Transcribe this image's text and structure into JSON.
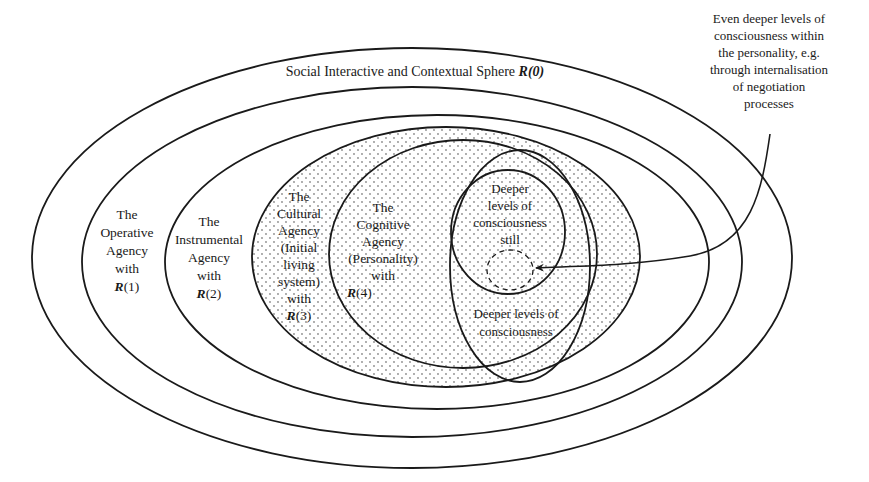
{
  "diagram": {
    "outer_sphere": {
      "label": "Social Interactive and Contextual Sphere ",
      "r_label": "R(0)"
    },
    "spheres": [
      {
        "id": "operative",
        "lines": [
          "The",
          "Operative",
          "Agency",
          "with"
        ],
        "r_label": "R",
        "r_index": "(1)"
      },
      {
        "id": "instrumental",
        "lines": [
          "The",
          "Instrumental",
          "Agency",
          "with"
        ],
        "r_label": "R",
        "r_index": "(2)"
      },
      {
        "id": "cultural",
        "lines": [
          "The",
          "Cultural",
          "Agency",
          "(Initial",
          "living",
          "system)",
          "with"
        ],
        "r_label": "R",
        "r_index": "(3)"
      },
      {
        "id": "cognitive",
        "lines": [
          "The",
          "Cognitive",
          "Agency",
          "(Personality)",
          "with"
        ],
        "r_label": "R",
        "r_index": "(4)"
      }
    ],
    "deeper": {
      "lines": [
        "Deeper levels of",
        "consciousness"
      ]
    },
    "deeper_still": {
      "lines": [
        "Deeper",
        "levels of",
        "consciousness",
        "still"
      ]
    },
    "annotation": {
      "lines": [
        "Even deeper levels of",
        "consciousness within",
        "the personality, e.g.",
        "through internalisation",
        "of negotiation",
        "processes"
      ]
    },
    "colors": {
      "stroke": "#1a1a1a",
      "dot": "#8a8a8a",
      "background": "#ffffff"
    }
  }
}
